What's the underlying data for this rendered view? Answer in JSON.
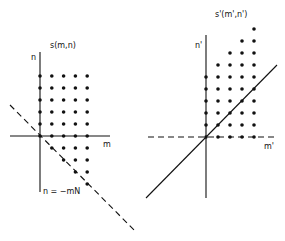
{
  "left": {
    "title": "s(m,n)",
    "n_axis_label": "n",
    "m_axis_label": "m",
    "line_label": "n = −mN",
    "origin": [
      40,
      136
    ],
    "spacing": [
      11.8,
      12
    ],
    "axis_v": [
      40,
      52,
      40,
      192
    ],
    "axis_h": [
      10,
      136,
      110,
      136
    ],
    "dashed_line": [
      10,
      105,
      136,
      232
    ],
    "support_points": [
      [
        0,
        5
      ],
      [
        1,
        5
      ],
      [
        2,
        5
      ],
      [
        3,
        5
      ],
      [
        4,
        5
      ],
      [
        0,
        4
      ],
      [
        1,
        4
      ],
      [
        2,
        4
      ],
      [
        3,
        4
      ],
      [
        4,
        4
      ],
      [
        0,
        3
      ],
      [
        1,
        3
      ],
      [
        2,
        3
      ],
      [
        3,
        3
      ],
      [
        4,
        3
      ],
      [
        0,
        2
      ],
      [
        1,
        2
      ],
      [
        2,
        2
      ],
      [
        3,
        2
      ],
      [
        4,
        2
      ],
      [
        0,
        1
      ],
      [
        1,
        1
      ],
      [
        2,
        1
      ],
      [
        3,
        1
      ],
      [
        4,
        1
      ],
      [
        0,
        0
      ],
      [
        1,
        0
      ],
      [
        2,
        0
      ],
      [
        3,
        0
      ],
      [
        4,
        0
      ],
      [
        1,
        -1
      ],
      [
        2,
        -1
      ],
      [
        3,
        -1
      ],
      [
        4,
        -1
      ],
      [
        2,
        -2
      ],
      [
        3,
        -2
      ],
      [
        4,
        -2
      ],
      [
        3,
        -3
      ],
      [
        4,
        -3
      ],
      [
        4,
        -4
      ]
    ]
  },
  "right": {
    "title": "s'(m',n')",
    "n_axis_label": "n'",
    "m_axis_label": "m'",
    "origin": [
      206,
      137
    ],
    "spacing": [
      12,
      12
    ],
    "axis_v": [
      206,
      35,
      206,
      198
    ],
    "axis_h_dashed": [
      148,
      137,
      276,
      137
    ],
    "diagonal_line": [
      146,
      198,
      277,
      65
    ],
    "support_points": [
      [
        0,
        0
      ],
      [
        1,
        0
      ],
      [
        2,
        0
      ],
      [
        3,
        0
      ],
      [
        4,
        0
      ],
      [
        0,
        1
      ],
      [
        1,
        1
      ],
      [
        2,
        1
      ],
      [
        3,
        1
      ],
      [
        4,
        1
      ],
      [
        0,
        2
      ],
      [
        1,
        2
      ],
      [
        2,
        2
      ],
      [
        3,
        2
      ],
      [
        4,
        2
      ],
      [
        0,
        3
      ],
      [
        1,
        3
      ],
      [
        2,
        3
      ],
      [
        3,
        3
      ],
      [
        4,
        3
      ],
      [
        0,
        4
      ],
      [
        1,
        4
      ],
      [
        2,
        4
      ],
      [
        3,
        4
      ],
      [
        4,
        4
      ],
      [
        0,
        5
      ],
      [
        1,
        5
      ],
      [
        2,
        5
      ],
      [
        3,
        5
      ],
      [
        4,
        5
      ],
      [
        1,
        6
      ],
      [
        2,
        6
      ],
      [
        3,
        6
      ],
      [
        4,
        6
      ],
      [
        2,
        7
      ],
      [
        3,
        7
      ],
      [
        4,
        7
      ],
      [
        3,
        8
      ],
      [
        4,
        8
      ],
      [
        4,
        9
      ]
    ]
  }
}
